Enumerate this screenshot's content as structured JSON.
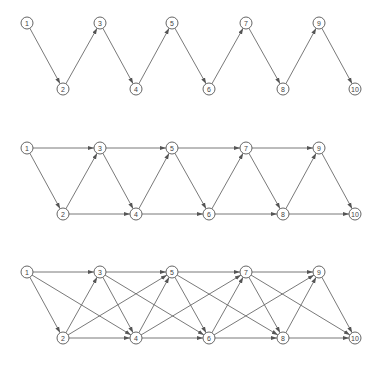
{
  "diagram": {
    "node_radius": 6,
    "colors": {
      "edge": "#6a6a6a",
      "node_stroke": "#555555",
      "node_fill": "#ffffff",
      "label": "#444444",
      "background": "#ffffff"
    },
    "node_x": [
      27,
      63,
      100,
      136,
      172,
      209,
      246,
      283,
      319,
      355
    ],
    "graphs": [
      {
        "name": "graph-k1",
        "description": "each node i connects to i+1",
        "top_y": 23,
        "bottom_y": 89,
        "nodes": [
          "1",
          "2",
          "3",
          "4",
          "5",
          "6",
          "7",
          "8",
          "9",
          "10"
        ],
        "edges": [
          [
            1,
            2
          ],
          [
            2,
            3
          ],
          [
            3,
            4
          ],
          [
            4,
            5
          ],
          [
            5,
            6
          ],
          [
            6,
            7
          ],
          [
            7,
            8
          ],
          [
            8,
            9
          ],
          [
            9,
            10
          ]
        ]
      },
      {
        "name": "graph-k2",
        "description": "each node i connects to i+1 and i+2",
        "top_y": 148,
        "bottom_y": 214,
        "nodes": [
          "1",
          "2",
          "3",
          "4",
          "5",
          "6",
          "7",
          "8",
          "9",
          "10"
        ],
        "edges": [
          [
            1,
            2
          ],
          [
            1,
            3
          ],
          [
            2,
            3
          ],
          [
            2,
            4
          ],
          [
            3,
            4
          ],
          [
            3,
            5
          ],
          [
            4,
            5
          ],
          [
            4,
            6
          ],
          [
            5,
            6
          ],
          [
            5,
            7
          ],
          [
            6,
            7
          ],
          [
            6,
            8
          ],
          [
            7,
            8
          ],
          [
            7,
            9
          ],
          [
            8,
            9
          ],
          [
            8,
            10
          ],
          [
            9,
            10
          ]
        ]
      },
      {
        "name": "graph-k3",
        "description": "each node i connects to i+1, i+2 and i+3",
        "top_y": 272,
        "bottom_y": 338,
        "nodes": [
          "1",
          "2",
          "3",
          "4",
          "5",
          "6",
          "7",
          "8",
          "9",
          "10"
        ],
        "edges": [
          [
            1,
            2
          ],
          [
            1,
            3
          ],
          [
            1,
            4
          ],
          [
            2,
            3
          ],
          [
            2,
            4
          ],
          [
            2,
            5
          ],
          [
            3,
            4
          ],
          [
            3,
            5
          ],
          [
            3,
            6
          ],
          [
            4,
            5
          ],
          [
            4,
            6
          ],
          [
            4,
            7
          ],
          [
            5,
            6
          ],
          [
            5,
            7
          ],
          [
            5,
            8
          ],
          [
            6,
            7
          ],
          [
            6,
            8
          ],
          [
            6,
            9
          ],
          [
            7,
            8
          ],
          [
            7,
            9
          ],
          [
            7,
            10
          ],
          [
            8,
            9
          ],
          [
            8,
            10
          ],
          [
            9,
            10
          ]
        ]
      }
    ]
  }
}
